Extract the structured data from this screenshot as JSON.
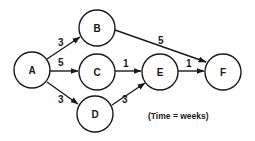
{
  "diagram": {
    "type": "activity-network",
    "note": "(Time = weeks)",
    "nodes": [
      {
        "id": "A",
        "label": "A",
        "x": 32,
        "y": 70
      },
      {
        "id": "B",
        "label": "B",
        "x": 97,
        "y": 28
      },
      {
        "id": "C",
        "label": "C",
        "x": 97,
        "y": 72
      },
      {
        "id": "D",
        "label": "D",
        "x": 95,
        "y": 114
      },
      {
        "id": "E",
        "label": "E",
        "x": 160,
        "y": 72
      },
      {
        "id": "F",
        "label": "F",
        "x": 223,
        "y": 72
      }
    ],
    "edges": [
      {
        "from": "A",
        "to": "B",
        "weight": "3"
      },
      {
        "from": "A",
        "to": "C",
        "weight": "5"
      },
      {
        "from": "A",
        "to": "D",
        "weight": "3"
      },
      {
        "from": "B",
        "to": "F",
        "weight": "5"
      },
      {
        "from": "C",
        "to": "E",
        "weight": "1"
      },
      {
        "from": "D",
        "to": "E",
        "weight": "3"
      },
      {
        "from": "E",
        "to": "F",
        "weight": "1"
      }
    ]
  }
}
